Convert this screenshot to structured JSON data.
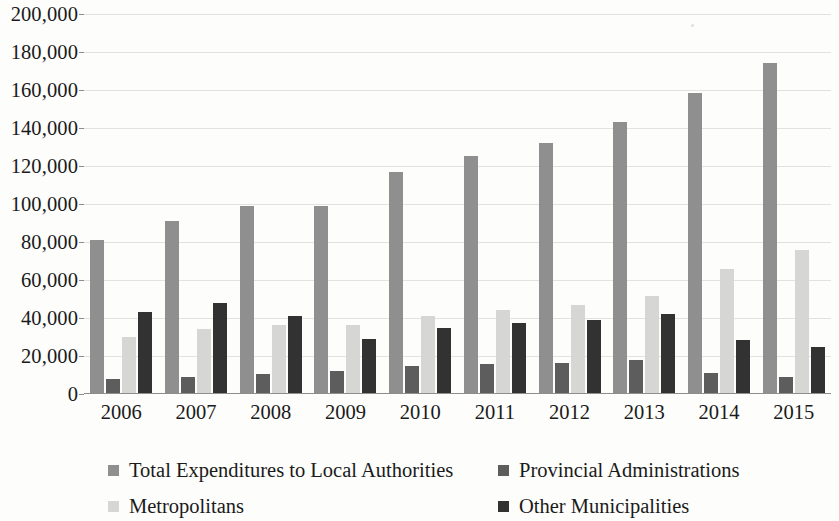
{
  "chart_data": {
    "type": "bar",
    "title": "",
    "subtitle": "",
    "xlabel": "",
    "ylabel": "",
    "grid": true,
    "legend_position": "bottom",
    "ylim": [
      0,
      200000
    ],
    "ytick_labels": [
      "200,000",
      "180,000",
      "160,000",
      "140,000",
      "120,000",
      "100,000",
      "80,000",
      "60,000",
      "40,000",
      "20,000",
      "0"
    ],
    "ytick_values": [
      200000,
      180000,
      160000,
      140000,
      120000,
      100000,
      80000,
      60000,
      40000,
      20000,
      0
    ],
    "categories": [
      "2006",
      "2007",
      "2008",
      "2009",
      "2010",
      "2011",
      "2012",
      "2013",
      "2014",
      "2015"
    ],
    "series": [
      {
        "name": "Total Expenditures to Local Authorities",
        "color": "#8f8f8f",
        "values": [
          81000,
          91000,
          99000,
          99000,
          117000,
          125500,
          132000,
          143000,
          158500,
          174000
        ]
      },
      {
        "name": "Provincial Administrations",
        "color": "#5d5d5d",
        "values": [
          8000,
          9000,
          10500,
          12000,
          14500,
          16000,
          16500,
          18000,
          11000,
          9000
        ]
      },
      {
        "name": "Metropolitans",
        "color": "#d6d6d4",
        "values": [
          30000,
          34000,
          36500,
          36500,
          41000,
          44000,
          47000,
          51500,
          66000,
          76000
        ]
      },
      {
        "name": "Other Municipalities",
        "color": "#323232",
        "values": [
          43000,
          48000,
          41000,
          29000,
          35000,
          37500,
          39000,
          42000,
          28500,
          24500
        ]
      }
    ]
  },
  "legend": {
    "entries": [
      {
        "label": "Total Expenditures to Local Authorities",
        "swatch": "s0"
      },
      {
        "label": "Provincial Administrations",
        "swatch": "s1"
      },
      {
        "label": "Metropolitans",
        "swatch": "s2"
      },
      {
        "label": "Other Municipalities",
        "swatch": "s3"
      }
    ]
  }
}
